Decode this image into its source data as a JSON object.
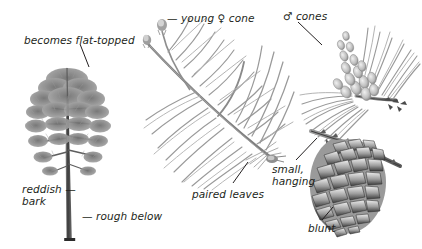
{
  "figure": {
    "kind": "botanical-field-guide-plate",
    "background_color": "#ffffff",
    "ink_color": "#231f20",
    "width": 422,
    "height": 249
  },
  "labels": [
    {
      "id": "flat-topped",
      "text": "becomes flat-topped",
      "x": 24,
      "y": 34,
      "lines": 1
    },
    {
      "id": "young-female-cone",
      "text": "— young ♀ cone",
      "x": 167,
      "y": 12,
      "lines": 1
    },
    {
      "id": "male-cones",
      "text": "♂ cones",
      "x": 283,
      "y": 10,
      "lines": 1
    },
    {
      "id": "reddish-bark",
      "text": "reddish —\nbark",
      "x": 22,
      "y": 183,
      "lines": 2
    },
    {
      "id": "rough-below",
      "text": "— rough below",
      "x": 82,
      "y": 210,
      "lines": 1
    },
    {
      "id": "paired-leaves",
      "text": "paired leaves",
      "x": 192,
      "y": 188,
      "lines": 1
    },
    {
      "id": "small-hanging",
      "text": "small,\nhanging",
      "x": 272,
      "y": 163,
      "lines": 2
    },
    {
      "id": "blunt",
      "text": "blunt",
      "x": 308,
      "y": 222,
      "lines": 1
    }
  ],
  "specimens": [
    {
      "id": "whole-tree",
      "name": "whole tree habit",
      "caption_refs": [
        "flat-topped",
        "reddish-bark",
        "rough-below"
      ]
    },
    {
      "id": "foliage-spray",
      "name": "shoot with paired needles and young female cone",
      "caption_refs": [
        "young-female-cone",
        "paired-leaves"
      ]
    },
    {
      "id": "male-cone-cluster",
      "name": "cluster of male pollen cones",
      "caption_refs": [
        "male-cones"
      ]
    },
    {
      "id": "mature-cone",
      "name": "mature woody seed cone",
      "caption_refs": [
        "small-hanging",
        "blunt"
      ]
    }
  ]
}
